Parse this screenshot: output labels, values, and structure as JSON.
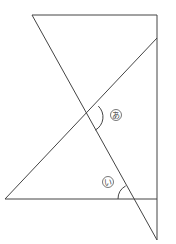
{
  "diagram": {
    "type": "geometry-angles",
    "stroke_color": "#444444",
    "background": "#ffffff",
    "labels": {
      "angle_a": "あ",
      "angle_i": "い"
    },
    "lines": [
      {
        "name": "top-edge",
        "from": [
          32,
          15
        ],
        "to": [
          157,
          15
        ]
      },
      {
        "name": "right-vertical",
        "from": [
          157,
          15
        ],
        "to": [
          157,
          240
        ]
      },
      {
        "name": "long-diagonal",
        "from": [
          32,
          15
        ],
        "to": [
          157,
          240
        ]
      },
      {
        "name": "rising-diagonal",
        "from": [
          5,
          199
        ],
        "to": [
          157,
          38
        ]
      },
      {
        "name": "base-horizontal",
        "from": [
          5,
          199
        ],
        "to": [
          157,
          199
        ]
      }
    ],
    "angles": [
      {
        "label": "あ",
        "vertex": [
          88,
          117
        ],
        "label_pos": [
          116,
          115
        ]
      },
      {
        "label": "い",
        "vertex": [
          133,
          199
        ],
        "label_pos": [
          108,
          182
        ]
      }
    ]
  }
}
